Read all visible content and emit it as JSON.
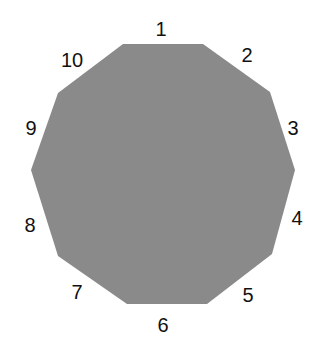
{
  "diagram": {
    "shape": "decagon",
    "fill_color": "#8a8a8a",
    "vertices": [
      [
        123,
        44
      ],
      [
        203,
        44
      ],
      [
        270,
        92
      ],
      [
        295,
        170
      ],
      [
        272,
        254
      ],
      [
        207,
        304
      ],
      [
        127,
        304
      ],
      [
        58,
        256
      ],
      [
        31,
        170
      ],
      [
        58,
        93
      ]
    ],
    "side_labels": [
      {
        "text": "1",
        "x": 161,
        "y": 36
      },
      {
        "text": "2",
        "x": 247,
        "y": 62
      },
      {
        "text": "3",
        "x": 293,
        "y": 135
      },
      {
        "text": "4",
        "x": 297,
        "y": 225
      },
      {
        "text": "5",
        "x": 248,
        "y": 302
      },
      {
        "text": "6",
        "x": 163,
        "y": 332
      },
      {
        "text": "7",
        "x": 77,
        "y": 299
      },
      {
        "text": "8",
        "x": 30,
        "y": 232
      },
      {
        "text": "9",
        "x": 31,
        "y": 135
      },
      {
        "text": "10",
        "x": 72,
        "y": 67
      }
    ]
  }
}
